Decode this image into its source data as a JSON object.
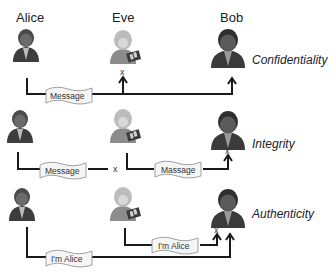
{
  "actors": {
    "alice": "Alice",
    "eve": "Eve",
    "bob": "Bob"
  },
  "rows": [
    {
      "property": "Confidentiality",
      "messages": [
        "Message"
      ],
      "blocked_marks": [
        "x"
      ]
    },
    {
      "property": "Integrity",
      "messages": [
        "Message",
        "Massage"
      ],
      "blocked_marks": [
        "x",
        "x"
      ]
    },
    {
      "property": "Authenticity",
      "messages": [
        "I'm Alice",
        "I'm Alice"
      ],
      "blocked_marks": [
        "x"
      ]
    }
  ],
  "colors": {
    "line": "#1a1a1a",
    "person_dark": "#3a3a3a",
    "person_light": "#a8a8a8",
    "bubble_fill": "#f4f4f4",
    "bubble_stroke": "#888888"
  }
}
